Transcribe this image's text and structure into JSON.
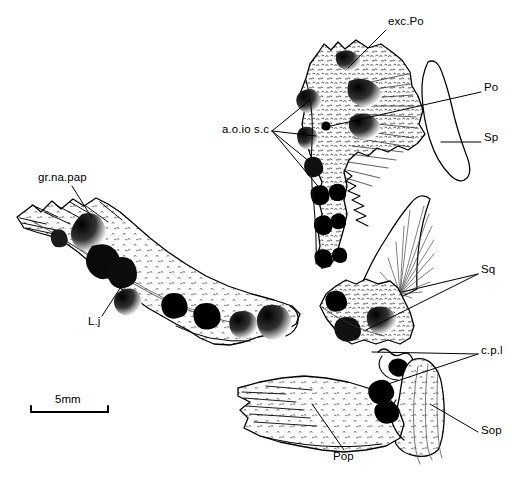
{
  "figure": {
    "kind": "scientific-line-drawing",
    "background_color": "#ffffff",
    "ink_color": "#000000",
    "scale_bar": {
      "label": "5mm",
      "x": 30,
      "y": 412,
      "length_px": 78
    },
    "labels": [
      {
        "id": "exc-po",
        "text": "exc.Po",
        "x": 388,
        "y": 22,
        "anchor": "left"
      },
      {
        "id": "po",
        "text": "Po",
        "x": 484,
        "y": 88,
        "anchor": "left"
      },
      {
        "id": "sp",
        "text": "Sp",
        "x": 484,
        "y": 138,
        "anchor": "left"
      },
      {
        "id": "aoiosc",
        "text": "a.o.io s.c",
        "x": 222,
        "y": 130,
        "anchor": "left"
      },
      {
        "id": "gr-na-pap",
        "text": "gr.na.pap",
        "x": 38,
        "y": 178,
        "anchor": "left"
      },
      {
        "id": "lj",
        "text": "L.j",
        "x": 89,
        "y": 320,
        "anchor": "left"
      },
      {
        "id": "sq",
        "text": "Sq",
        "x": 481,
        "y": 270,
        "anchor": "left"
      },
      {
        "id": "cpl",
        "text": "c.p.l",
        "x": 481,
        "y": 350,
        "anchor": "left"
      },
      {
        "id": "sop",
        "text": "Sop",
        "x": 481,
        "y": 431,
        "anchor": "left"
      },
      {
        "id": "pop",
        "text": "Pop",
        "x": 333,
        "y": 456,
        "anchor": "left"
      }
    ],
    "bones": [
      {
        "id": "postorbital-region",
        "label_ref": "exc-po"
      },
      {
        "id": "preoperculum-upper",
        "label_ref": "po"
      },
      {
        "id": "suprapreoperculum",
        "label_ref": "sp"
      },
      {
        "id": "lower-jaw",
        "label_ref": "lj"
      },
      {
        "id": "squamosal",
        "label_ref": "sq"
      },
      {
        "id": "suboperculum",
        "label_ref": "sop"
      },
      {
        "id": "preoperculum-lower",
        "label_ref": "pop"
      }
    ]
  }
}
